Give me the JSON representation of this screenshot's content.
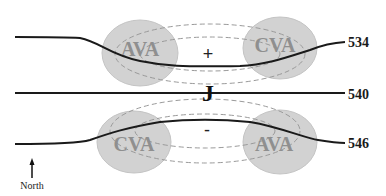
{
  "diagram": {
    "vorticity_centers": [
      {
        "label": "AVA",
        "position": "upper-left"
      },
      {
        "label": "CVA",
        "position": "upper-right"
      },
      {
        "label": "CVA",
        "position": "lower-left"
      },
      {
        "label": "AVA",
        "position": "lower-right"
      }
    ],
    "contours": [
      {
        "label": "534",
        "position": "top"
      },
      {
        "label": "540",
        "position": "middle"
      },
      {
        "label": "546",
        "position": "bottom"
      }
    ],
    "jet_label": "J",
    "signs": {
      "upper": "+",
      "lower": "-"
    },
    "north_label": "North",
    "colors": {
      "blob_fill": "#cfcfcf",
      "blob_text": "#8f8f8f",
      "contour": "#1a1a1a",
      "dashed": "#9a9a9a"
    }
  }
}
